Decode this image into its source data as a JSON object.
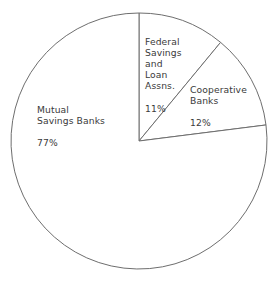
{
  "chart_data": {
    "type": "pie",
    "title": "",
    "subtitle": "",
    "xlabel": "",
    "ylabel": "",
    "legend_position": "none",
    "grid": false,
    "labels_inside": true,
    "start_angle_deg": 0,
    "direction": "clockwise",
    "categories": [
      "Federal Savings and Loan Assns.",
      "Cooperative Banks",
      "Mutual Savings Banks"
    ],
    "values": [
      11,
      12,
      77
    ],
    "value_unit": "%",
    "slices": [
      {
        "name": "Federal Savings and Loan Assns.",
        "label_text": "Federal\nSavings\nand\nLoan\nAssns.",
        "value": 11,
        "value_label": "11%",
        "angle_deg": 39.6,
        "start_deg": 0,
        "end_deg": 39.6,
        "fill": "#ffffff",
        "stroke": "#6e6e6e"
      },
      {
        "name": "Cooperative Banks",
        "label_text": "Cooperative\nBanks",
        "value": 12,
        "value_label": "12%",
        "angle_deg": 43.2,
        "start_deg": 39.6,
        "end_deg": 82.8,
        "fill": "#ffffff",
        "stroke": "#6e6e6e"
      },
      {
        "name": "Mutual Savings Banks",
        "label_text": "Mutual\nSavings Banks",
        "value": 77,
        "value_label": "77%",
        "angle_deg": 277.2,
        "start_deg": 82.8,
        "end_deg": 360,
        "fill": "#ffffff",
        "stroke": "#6e6e6e"
      }
    ],
    "geometry": {
      "center_x": 139,
      "center_y": 141,
      "radius": 128
    },
    "colors": {
      "background": "#ffffff",
      "stroke": "#6e6e6e",
      "text": "#3a3a3a"
    }
  }
}
